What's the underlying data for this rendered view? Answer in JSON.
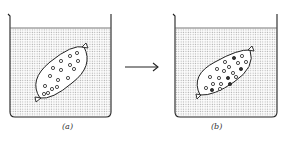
{
  "figure": {
    "panels": [
      {
        "id": "a",
        "label": "(a)",
        "description": "Dialysis bag containing open circles (solute particles) immersed in water in a beaker",
        "filled_particles": 0,
        "open_particles": 16
      },
      {
        "id": "b",
        "label": "(b)",
        "description": "Dialysis bag after time; some particles are now dark (mixed), showing exchange across membrane",
        "filled_particles": 5,
        "open_particles": 15
      }
    ],
    "arrow": {
      "direction": "right",
      "meaning": "time progression"
    }
  },
  "colors": {
    "line": "#222222",
    "water_dot": "#9a9a9a",
    "background": "#ffffff"
  }
}
